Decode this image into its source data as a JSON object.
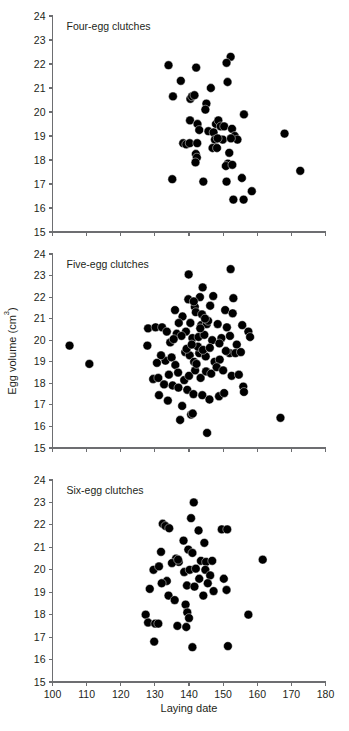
{
  "figure": {
    "xlabel": "Laying date",
    "ylabel_main": "Egg volume (cm",
    "ylabel_sup": "3",
    "ylabel_close": ")",
    "ylabel_full": "Egg volume (cm3)",
    "marker_color": "#000000",
    "axis_color": "#6d6e71",
    "text_color": "#231f20",
    "background": "#ffffff"
  },
  "axes": {
    "x_ticks": [
      100,
      110,
      120,
      130,
      140,
      150,
      160,
      170,
      180
    ],
    "y_ticks": [
      15,
      16,
      17,
      18,
      19,
      20,
      21,
      22,
      23,
      24
    ],
    "xlim": [
      100,
      180
    ],
    "ylim": [
      15,
      24
    ]
  },
  "chart_data": [
    {
      "type": "scatter",
      "title": "Four-egg clutches",
      "xlabel": "Laying date",
      "ylabel": "Egg volume (cm3)",
      "xlim": [
        100,
        180
      ],
      "ylim": [
        15,
        24
      ],
      "grid": false,
      "legend": "none",
      "points": [
        [
          134.0,
          21.95
        ],
        [
          137.6,
          21.3
        ],
        [
          135.3,
          20.65
        ],
        [
          142.1,
          21.85
        ],
        [
          146.4,
          21.0
        ],
        [
          152.2,
          22.3
        ],
        [
          151.0,
          22.05
        ],
        [
          151.3,
          21.25
        ],
        [
          140.4,
          20.55
        ],
        [
          140.9,
          20.65
        ],
        [
          141.6,
          20.7
        ],
        [
          145.1,
          20.35
        ],
        [
          144.8,
          20.1
        ],
        [
          156.1,
          19.9
        ],
        [
          140.3,
          19.65
        ],
        [
          142.5,
          19.5
        ],
        [
          143.0,
          19.25
        ],
        [
          147.9,
          19.5
        ],
        [
          148.6,
          19.65
        ],
        [
          149.3,
          19.4
        ],
        [
          150.3,
          19.4
        ],
        [
          152.6,
          19.3
        ],
        [
          145.7,
          19.2
        ],
        [
          147.2,
          19.15
        ],
        [
          149.9,
          18.85
        ],
        [
          153.4,
          19.0
        ],
        [
          154.2,
          18.85
        ],
        [
          168.0,
          19.1
        ],
        [
          138.3,
          18.7
        ],
        [
          139.2,
          18.65
        ],
        [
          140.2,
          18.7
        ],
        [
          142.4,
          18.7
        ],
        [
          147.6,
          18.85
        ],
        [
          148.4,
          18.9
        ],
        [
          152.3,
          18.9
        ],
        [
          146.9,
          18.5
        ],
        [
          148.2,
          18.5
        ],
        [
          151.8,
          18.3
        ],
        [
          142.0,
          18.25
        ],
        [
          142.3,
          18.1
        ],
        [
          141.9,
          17.9
        ],
        [
          151.4,
          17.85
        ],
        [
          150.8,
          17.75
        ],
        [
          152.7,
          17.8
        ],
        [
          135.1,
          17.2
        ],
        [
          144.2,
          17.1
        ],
        [
          151.0,
          17.1
        ],
        [
          155.5,
          17.25
        ],
        [
          158.4,
          16.7
        ],
        [
          153.0,
          16.35
        ],
        [
          156.0,
          16.35
        ],
        [
          172.6,
          17.55
        ]
      ]
    },
    {
      "type": "scatter",
      "title": "Five-egg clutches",
      "xlabel": "Laying date",
      "ylabel": "Egg volume (cm3)",
      "xlim": [
        100,
        180
      ],
      "ylim": [
        15,
        24
      ],
      "grid": false,
      "legend": "none",
      "points": [
        [
          105.0,
          19.75
        ],
        [
          110.8,
          18.9
        ],
        [
          139.9,
          23.05
        ],
        [
          152.2,
          23.3
        ],
        [
          144.0,
          22.45
        ],
        [
          143.2,
          22.0
        ],
        [
          147.1,
          22.05
        ],
        [
          153.0,
          21.95
        ],
        [
          135.9,
          21.4
        ],
        [
          138.1,
          21.1
        ],
        [
          141.7,
          21.55
        ],
        [
          146.2,
          21.6
        ],
        [
          150.6,
          21.4
        ],
        [
          152.8,
          21.25
        ],
        [
          128.0,
          20.55
        ],
        [
          130.2,
          20.6
        ],
        [
          132.1,
          20.6
        ],
        [
          137.0,
          20.8
        ],
        [
          140.4,
          20.8
        ],
        [
          143.6,
          20.7
        ],
        [
          145.2,
          20.75
        ],
        [
          148.4,
          20.75
        ],
        [
          151.1,
          20.6
        ],
        [
          155.6,
          20.7
        ],
        [
          157.4,
          20.4
        ],
        [
          157.9,
          20.15
        ],
        [
          127.8,
          19.75
        ],
        [
          134.5,
          19.9
        ],
        [
          136.4,
          20.3
        ],
        [
          139.1,
          20.4
        ],
        [
          141.0,
          20.1
        ],
        [
          142.8,
          20.15
        ],
        [
          144.5,
          20.25
        ],
        [
          146.8,
          20.0
        ],
        [
          149.5,
          20.1
        ],
        [
          152.0,
          20.2
        ],
        [
          154.0,
          19.8
        ],
        [
          133.1,
          19.05
        ],
        [
          134.9,
          19.2
        ],
        [
          136.0,
          18.85
        ],
        [
          138.9,
          19.45
        ],
        [
          140.2,
          19.3
        ],
        [
          141.5,
          19.0
        ],
        [
          143.0,
          19.4
        ],
        [
          144.9,
          19.25
        ],
        [
          147.5,
          19.0
        ],
        [
          149.0,
          19.1
        ],
        [
          151.9,
          19.4
        ],
        [
          153.6,
          19.4
        ],
        [
          155.2,
          19.45
        ],
        [
          129.5,
          18.2
        ],
        [
          131.0,
          18.25
        ],
        [
          134.1,
          18.4
        ],
        [
          136.8,
          18.5
        ],
        [
          138.6,
          18.15
        ],
        [
          140.0,
          18.35
        ],
        [
          141.8,
          18.6
        ],
        [
          143.4,
          18.25
        ],
        [
          145.0,
          18.55
        ],
        [
          146.5,
          18.45
        ],
        [
          148.1,
          18.75
        ],
        [
          150.0,
          18.6
        ],
        [
          152.5,
          18.35
        ],
        [
          154.6,
          18.4
        ],
        [
          132.7,
          17.95
        ],
        [
          135.2,
          17.9
        ],
        [
          136.9,
          17.8
        ],
        [
          139.5,
          17.7
        ],
        [
          141.3,
          17.5
        ],
        [
          143.9,
          17.45
        ],
        [
          146.0,
          17.25
        ],
        [
          148.8,
          17.4
        ],
        [
          150.3,
          17.55
        ],
        [
          155.9,
          17.85
        ],
        [
          156.1,
          17.6
        ],
        [
          131.2,
          17.45
        ],
        [
          133.8,
          17.2
        ],
        [
          138.0,
          16.95
        ],
        [
          140.6,
          16.55
        ],
        [
          141.1,
          16.6
        ],
        [
          137.4,
          16.3
        ],
        [
          145.3,
          15.7
        ],
        [
          166.8,
          16.4
        ],
        [
          139.8,
          21.9
        ],
        [
          141.4,
          21.8
        ],
        [
          142.0,
          21.3
        ],
        [
          143.8,
          21.2
        ],
        [
          145.6,
          20.9
        ],
        [
          137.8,
          20.2
        ],
        [
          139.3,
          19.6
        ],
        [
          142.6,
          19.7
        ],
        [
          144.1,
          19.55
        ],
        [
          146.1,
          19.65
        ],
        [
          148.9,
          19.85
        ],
        [
          150.8,
          19.5
        ],
        [
          135.5,
          20.05
        ],
        [
          133.5,
          20.4
        ],
        [
          131.8,
          19.3
        ],
        [
          130.6,
          18.95
        ],
        [
          142.2,
          18.9
        ],
        [
          140.8,
          19.8
        ],
        [
          143.3,
          20.55
        ],
        [
          144.7,
          21.0
        ]
      ]
    },
    {
      "type": "scatter",
      "title": "Six-egg clutches",
      "xlabel": "Laying date",
      "ylabel": "Egg volume (cm3)",
      "xlim": [
        100,
        180
      ],
      "ylim": [
        15,
        24
      ],
      "grid": false,
      "legend": "none",
      "points": [
        [
          141.4,
          23.0
        ],
        [
          140.6,
          22.3
        ],
        [
          132.3,
          22.05
        ],
        [
          133.1,
          21.95
        ],
        [
          134.2,
          21.85
        ],
        [
          142.8,
          21.75
        ],
        [
          149.6,
          21.8
        ],
        [
          151.2,
          21.8
        ],
        [
          138.4,
          21.3
        ],
        [
          131.8,
          20.8
        ],
        [
          136.2,
          20.5
        ],
        [
          137.0,
          20.35
        ],
        [
          139.8,
          20.9
        ],
        [
          141.0,
          20.75
        ],
        [
          143.5,
          20.4
        ],
        [
          145.0,
          20.35
        ],
        [
          146.8,
          20.4
        ],
        [
          144.5,
          21.2
        ],
        [
          161.6,
          20.45
        ],
        [
          129.6,
          20.0
        ],
        [
          131.2,
          20.15
        ],
        [
          133.5,
          19.5
        ],
        [
          135.0,
          20.3
        ],
        [
          136.8,
          20.45
        ],
        [
          138.6,
          19.9
        ],
        [
          140.2,
          20.0
        ],
        [
          142.0,
          20.05
        ],
        [
          143.0,
          19.6
        ],
        [
          144.8,
          20.0
        ],
        [
          146.2,
          19.75
        ],
        [
          128.5,
          19.15
        ],
        [
          132.0,
          19.4
        ],
        [
          134.0,
          18.85
        ],
        [
          135.8,
          18.65
        ],
        [
          139.4,
          19.3
        ],
        [
          141.6,
          19.25
        ],
        [
          145.5,
          19.4
        ],
        [
          147.2,
          19.05
        ],
        [
          150.2,
          19.6
        ],
        [
          151.0,
          19.1
        ],
        [
          144.2,
          18.85
        ],
        [
          127.3,
          18.0
        ],
        [
          128.0,
          17.65
        ],
        [
          130.1,
          17.6
        ],
        [
          131.0,
          17.6
        ],
        [
          136.6,
          17.5
        ],
        [
          139.0,
          18.45
        ],
        [
          139.5,
          18.1
        ],
        [
          140.0,
          17.85
        ],
        [
          139.2,
          17.45
        ],
        [
          157.4,
          18.0
        ],
        [
          129.8,
          16.8
        ],
        [
          141.0,
          16.55
        ],
        [
          151.4,
          16.6
        ]
      ]
    }
  ]
}
